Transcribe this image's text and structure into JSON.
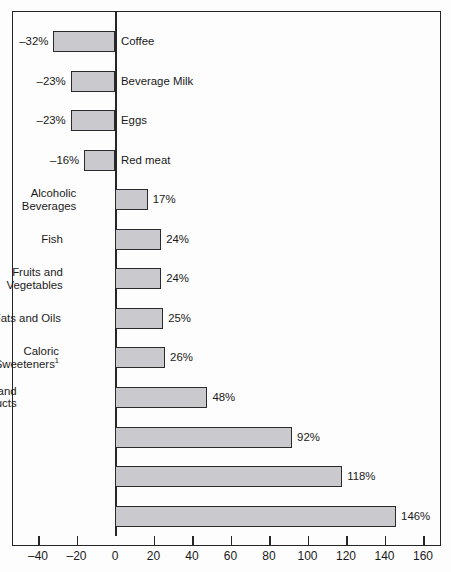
{
  "chart_data": {
    "type": "bar",
    "orientation": "horizontal",
    "title": "",
    "subtitle": "",
    "xlabel": "",
    "ylabel": "",
    "xlim": [
      -50,
      167
    ],
    "xticks": [
      -40,
      -20,
      0,
      20,
      40,
      60,
      80,
      100,
      120,
      140,
      160
    ],
    "xtick_labels": [
      "–40",
      "–20",
      "0",
      "20",
      "40",
      "60",
      "80",
      "100",
      "120",
      "140",
      "160"
    ],
    "grid": false,
    "legend": false,
    "value_suffix": "%",
    "categories": [
      "Coffee",
      "Beverage Milk",
      "Eggs",
      "Red meat",
      "Alcoholic Beverages",
      "Fish",
      "Fruits and Vegetables",
      "Fats and Oils",
      "Caloric Sweeteners",
      "Flour and Cereal Products",
      "Poultry",
      "Carbonated Soft Drinks",
      "Cheese"
    ],
    "values": [
      -32,
      -23,
      -23,
      -16,
      17,
      24,
      24,
      25,
      26,
      48,
      92,
      118,
      146
    ],
    "value_labels": [
      "–32%",
      "–23%",
      "–23%",
      "–16%",
      "17%",
      "24%",
      "24%",
      "25%",
      "26%",
      "48%",
      "92%",
      "118%",
      "146%"
    ],
    "bars": [
      {
        "label_line1": "Coffee",
        "label_line2": "",
        "value": -32,
        "value_label": "–32%",
        "label_side": "right",
        "footnote": ""
      },
      {
        "label_line1": "Beverage Milk",
        "label_line2": "",
        "value": -23,
        "value_label": "–23%",
        "label_side": "right",
        "footnote": ""
      },
      {
        "label_line1": "Eggs",
        "label_line2": "",
        "value": -23,
        "value_label": "–23%",
        "label_side": "right",
        "footnote": ""
      },
      {
        "label_line1": "Red meat",
        "label_line2": "",
        "value": -16,
        "value_label": "–16%",
        "label_side": "right",
        "footnote": ""
      },
      {
        "label_line1": "Alcoholic",
        "label_line2": "Beverages",
        "value": 17,
        "value_label": "17%",
        "label_side": "left",
        "footnote": ""
      },
      {
        "label_line1": "Fish",
        "label_line2": "",
        "value": 24,
        "value_label": "24%",
        "label_side": "left",
        "footnote": ""
      },
      {
        "label_line1": "Fruits and",
        "label_line2": "Vegetables",
        "value": 24,
        "value_label": "24%",
        "label_side": "left",
        "footnote": ""
      },
      {
        "label_line1": "Fats and Oils",
        "label_line2": "",
        "value": 25,
        "value_label": "25%",
        "label_side": "left",
        "footnote": ""
      },
      {
        "label_line1": "Caloric",
        "label_line2": "Sweeteners",
        "value": 26,
        "value_label": "26%",
        "label_side": "left",
        "footnote": "1"
      },
      {
        "label_line1": "Flour and",
        "label_line2": "Cereal Products",
        "value": 48,
        "value_label": "48%",
        "label_side": "left",
        "footnote": ""
      },
      {
        "label_line1": "Poultry",
        "label_line2": "",
        "value": 92,
        "value_label": "92%",
        "label_side": "left",
        "footnote": ""
      },
      {
        "label_line1": "Carbonated",
        "label_line2": "Soft Drinks",
        "value": 118,
        "value_label": "118%",
        "label_side": "left",
        "footnote": ""
      },
      {
        "label_line1": "Cheese",
        "label_line2": "",
        "value": 146,
        "value_label": "146%",
        "label_side": "left",
        "footnote": ""
      }
    ],
    "colors": {
      "bar_fill": "#c9c9ce",
      "bar_border": "#2b2b2b",
      "axis": "#262626",
      "text": "#1a1a1a",
      "background": "#fdfdfd"
    }
  }
}
